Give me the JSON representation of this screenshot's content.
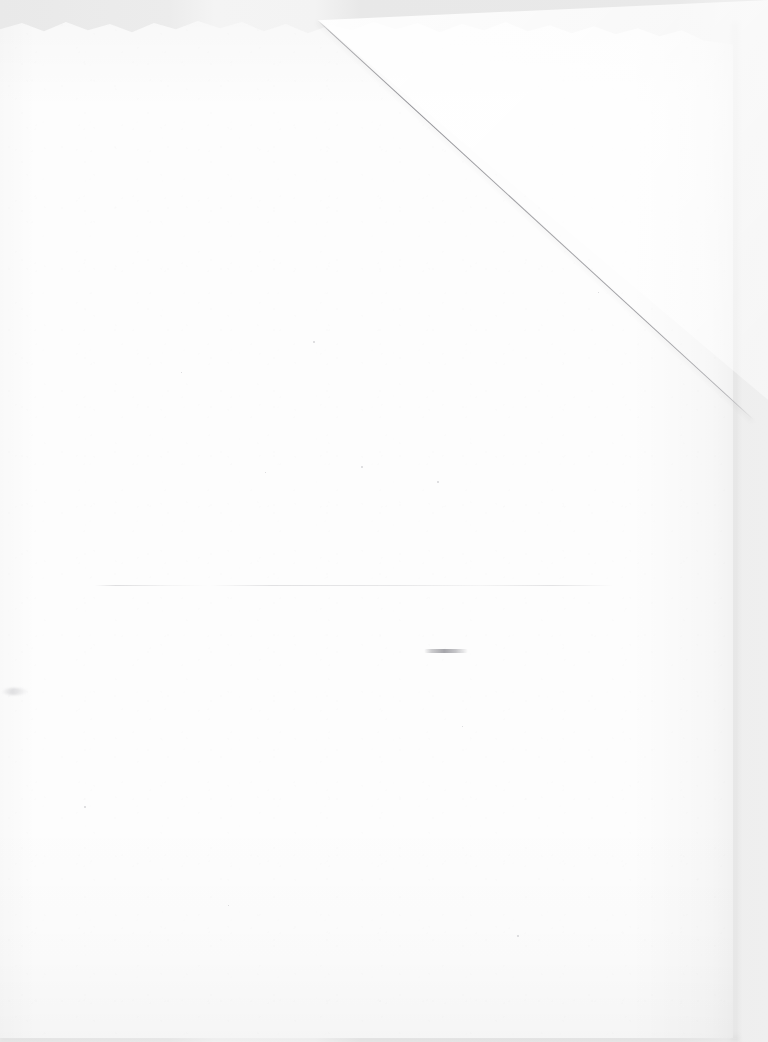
{
  "image": {
    "subject": "blank sheet of white paper",
    "capture_kind": "flatbed scan / overhead photograph",
    "width_px": 768,
    "height_px": 1042,
    "has_text": false,
    "text_content": "",
    "description": "An empty off-white sheet of paper on a light grey background. The sheet carries no printing or writing. Visible physical artifacts are a diagonal fold crease across the upper-right corner, a faint horizontal crease across the middle, a small grey smudge, and a slightly ragged top edge."
  },
  "colors": {
    "backdrop_grey": "#ebebeb",
    "backdrop_light_patch": "#f4f4f4",
    "paper_white": "#fdfdfd",
    "crease_line": "#70707a",
    "mid_crease_line": "#9a9aa2",
    "smudge_grey": "#707078",
    "shadow": "rgba(0,0,0,0.04)"
  },
  "paper": {
    "left_px": 0,
    "top_px": 18,
    "width_px": 733,
    "height_px": 1020,
    "top_edge": "ragged / torn",
    "right_edge": "soft cast shadow",
    "bottom_edge": "soft cast shadow"
  },
  "artifacts": [
    {
      "name": "folded-corner-crease",
      "kind": "diagonal fold crease",
      "start_px": [
        318,
        20
      ],
      "end_px": [
        745,
        400
      ],
      "angle_deg": 42.5,
      "note": "dog-eared upper-right corner; triangle beyond the crease reads slightly lighter than the sheet"
    },
    {
      "name": "horizontal-crease",
      "kind": "faint horizontal crease",
      "start_px": [
        95,
        585
      ],
      "end_px": [
        615,
        585
      ],
      "note": "broken, very low contrast; fades out toward the right"
    },
    {
      "name": "grey-smudge",
      "kind": "smudge mark",
      "center_px": [
        446,
        651
      ],
      "width_px": 44,
      "height_px": 4,
      "note": "short horizontal grey streak, not legible as text"
    },
    {
      "name": "left-edge-smudge",
      "kind": "smudge mark",
      "center_px": [
        15,
        691
      ],
      "width_px": 26,
      "height_px": 7,
      "note": "faint scuff near the left edge"
    }
  ],
  "specks": [
    {
      "x": 313,
      "y": 341,
      "d": 2
    },
    {
      "x": 361,
      "y": 466,
      "d": 2
    },
    {
      "x": 437,
      "y": 481,
      "d": 2
    },
    {
      "x": 265,
      "y": 472,
      "d": 1
    },
    {
      "x": 84,
      "y": 806,
      "d": 2
    },
    {
      "x": 517,
      "y": 935,
      "d": 2
    },
    {
      "x": 181,
      "y": 372,
      "d": 1
    },
    {
      "x": 598,
      "y": 292,
      "d": 1
    },
    {
      "x": 462,
      "y": 726,
      "d": 1
    },
    {
      "x": 228,
      "y": 905,
      "d": 1
    }
  ]
}
